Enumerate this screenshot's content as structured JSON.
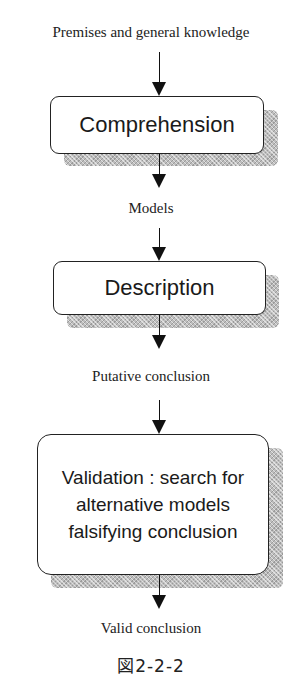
{
  "diagram": {
    "input_label": "Premises and general knowledge",
    "steps": [
      {
        "label": "Comprehension",
        "output_label": "Models"
      },
      {
        "label": "Description",
        "output_label": "Putative conclusion"
      },
      {
        "label_lines": [
          "Validation : search for",
          "alternative models",
          "falsifying conclusion"
        ],
        "output_label": "Valid conclusion"
      }
    ],
    "caption": "図2-2-2"
  }
}
